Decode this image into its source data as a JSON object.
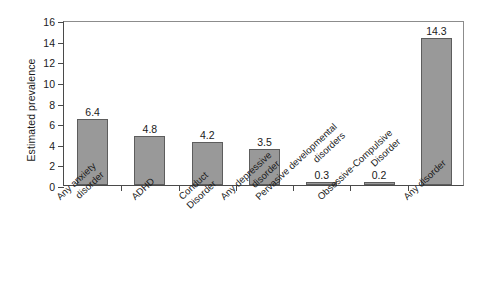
{
  "chart_data": {
    "type": "bar",
    "title": "",
    "xlabel": "",
    "ylabel": "Estimated prevalence",
    "ylim": [
      0,
      16
    ],
    "ytick_values": [
      0,
      2,
      4,
      6,
      8,
      10,
      12,
      14,
      16
    ],
    "ytick_labels": [
      "0",
      "2",
      "4",
      "6",
      "8",
      "10",
      "12",
      "14",
      "16"
    ],
    "grid": false,
    "legend": false,
    "bar_color": "#999999",
    "bar_edge_color": "#5d5d5d",
    "axis_color": "#4a4a4a",
    "categories": [
      "Any anxiety disorder",
      "ADHD",
      "Conduct Disorder",
      "Any depressive disorder",
      "Pervasive developmental disorders",
      "Obsessive-Compulsive Disorder",
      "Any disorder"
    ],
    "category_lines": [
      [
        "Any anxiety",
        "disorder"
      ],
      [
        "ADHD"
      ],
      [
        "Conduct",
        "Disorder"
      ],
      [
        "Any depressive",
        "disorder"
      ],
      [
        "Pervasive developmental",
        "disorders"
      ],
      [
        "Obsessive-Compulsive",
        "Disorder"
      ],
      [
        "Any disorder"
      ]
    ],
    "values": [
      6.4,
      4.8,
      4.2,
      3.5,
      0.3,
      0.2,
      14.3
    ],
    "value_labels": [
      "6.4",
      "4.8",
      "4.2",
      "3.5",
      "0.3",
      "0.2",
      "14.3"
    ]
  }
}
